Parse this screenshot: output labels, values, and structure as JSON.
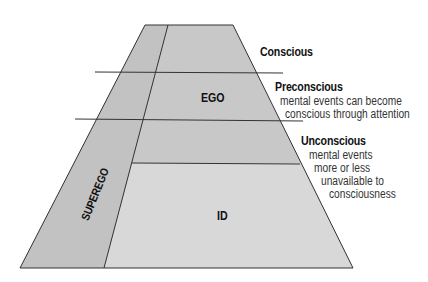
{
  "diagram": {
    "regions": {
      "ego": "EGO",
      "id": "ID",
      "superego": "SUPEREGO"
    },
    "levels": [
      {
        "title": "Conscious",
        "description": []
      },
      {
        "title": "Preconscious",
        "description": [
          "mental events can become",
          "conscious through attention"
        ]
      },
      {
        "title": "Unconscious",
        "description": [
          "mental events",
          "more or less",
          "unavailable to",
          "consciousness"
        ]
      }
    ],
    "colors": {
      "fill_upper": "#c6c6c6",
      "fill_id": "#d6d6d6",
      "fill_superego": "#c4c4c4",
      "stroke": "#333333"
    }
  }
}
